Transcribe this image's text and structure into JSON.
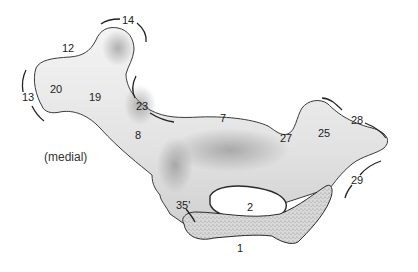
{
  "figure": {
    "view_label": "(medial)",
    "colors": {
      "background": "#ffffff",
      "bone_fill": "#ececec",
      "bone_shade": "#9a9a9a",
      "outline": "#2a2a2a",
      "text": "#222222"
    },
    "labels": [
      {
        "id": "14",
        "text": "14",
        "x": 122,
        "y": 15
      },
      {
        "id": "12",
        "text": "12",
        "x": 62,
        "y": 43
      },
      {
        "id": "13",
        "text": "13",
        "x": 22,
        "y": 92
      },
      {
        "id": "20",
        "text": "20",
        "x": 50,
        "y": 84
      },
      {
        "id": "19",
        "text": "19",
        "x": 89,
        "y": 92
      },
      {
        "id": "23",
        "text": "23",
        "x": 136,
        "y": 101
      },
      {
        "id": "8",
        "text": "8",
        "x": 135,
        "y": 130
      },
      {
        "id": "7",
        "text": "7",
        "x": 220,
        "y": 113
      },
      {
        "id": "27",
        "text": "27",
        "x": 280,
        "y": 133
      },
      {
        "id": "25",
        "text": "25",
        "x": 318,
        "y": 128
      },
      {
        "id": "28",
        "text": "28",
        "x": 351,
        "y": 115
      },
      {
        "id": "29",
        "text": "29",
        "x": 351,
        "y": 175
      },
      {
        "id": "35p",
        "text": "35'",
        "x": 176,
        "y": 200
      },
      {
        "id": "2",
        "text": "2",
        "x": 247,
        "y": 202
      },
      {
        "id": "1",
        "text": "1",
        "x": 237,
        "y": 243
      }
    ]
  }
}
